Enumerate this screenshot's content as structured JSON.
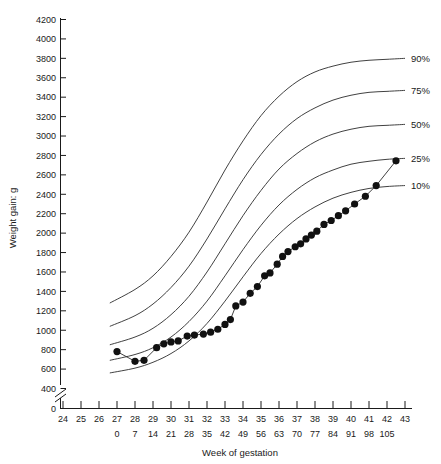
{
  "chart_data": {
    "type": "line",
    "title": "",
    "xlabel": "Week of gestation",
    "ylabel": "Weight gain: g",
    "xlim": [
      24,
      43
    ],
    "ylim": [
      400,
      4200
    ],
    "y_axis_break": true,
    "y_zero_label": "0",
    "grid": false,
    "legend_position": "right-inline",
    "x_ticks_weeks": [
      24,
      25,
      26,
      27,
      28,
      29,
      30,
      31,
      32,
      33,
      34,
      35,
      36,
      37,
      38,
      39,
      40,
      41,
      42,
      43
    ],
    "x_ticks_days": [
      {
        "week": 27,
        "day": 0
      },
      {
        "week": 28,
        "day": 7
      },
      {
        "week": 29,
        "day": 14
      },
      {
        "week": 30,
        "day": 21
      },
      {
        "week": 31,
        "day": 28
      },
      {
        "week": 32,
        "day": 35
      },
      {
        "week": 33,
        "day": 42
      },
      {
        "week": 34,
        "day": 49
      },
      {
        "week": 35,
        "day": 56
      },
      {
        "week": 36,
        "day": 63
      },
      {
        "week": 37,
        "day": 70
      },
      {
        "week": 38,
        "day": 77
      },
      {
        "week": 39,
        "day": 84
      },
      {
        "week": 40,
        "day": 91
      },
      {
        "week": 41,
        "day": 98
      },
      {
        "week": 42,
        "day": 105
      }
    ],
    "y_ticks": [
      400,
      600,
      800,
      1000,
      1200,
      1400,
      1600,
      1800,
      2000,
      2200,
      2400,
      2600,
      2800,
      3000,
      3200,
      3400,
      3600,
      3800,
      4000,
      4200
    ],
    "series": [
      {
        "name": "90%",
        "label": "90%",
        "type": "percentile_curve",
        "points": [
          {
            "x": 26.6,
            "y": 1280
          },
          {
            "x": 28.0,
            "y": 1420
          },
          {
            "x": 29.0,
            "y": 1560
          },
          {
            "x": 30.0,
            "y": 1760
          },
          {
            "x": 31.0,
            "y": 2010
          },
          {
            "x": 32.0,
            "y": 2320
          },
          {
            "x": 33.0,
            "y": 2650
          },
          {
            "x": 34.0,
            "y": 2950
          },
          {
            "x": 35.0,
            "y": 3210
          },
          {
            "x": 36.0,
            "y": 3410
          },
          {
            "x": 37.0,
            "y": 3560
          },
          {
            "x": 38.0,
            "y": 3660
          },
          {
            "x": 39.0,
            "y": 3720
          },
          {
            "x": 40.0,
            "y": 3760
          },
          {
            "x": 41.0,
            "y": 3780
          },
          {
            "x": 42.0,
            "y": 3790
          },
          {
            "x": 43.0,
            "y": 3800
          }
        ]
      },
      {
        "name": "75%",
        "label": "75%",
        "type": "percentile_curve",
        "points": [
          {
            "x": 26.6,
            "y": 1040
          },
          {
            "x": 28.0,
            "y": 1150
          },
          {
            "x": 29.0,
            "y": 1270
          },
          {
            "x": 30.0,
            "y": 1440
          },
          {
            "x": 31.0,
            "y": 1660
          },
          {
            "x": 32.0,
            "y": 1940
          },
          {
            "x": 33.0,
            "y": 2250
          },
          {
            "x": 34.0,
            "y": 2550
          },
          {
            "x": 35.0,
            "y": 2810
          },
          {
            "x": 36.0,
            "y": 3020
          },
          {
            "x": 37.0,
            "y": 3180
          },
          {
            "x": 38.0,
            "y": 3290
          },
          {
            "x": 39.0,
            "y": 3370
          },
          {
            "x": 40.0,
            "y": 3420
          },
          {
            "x": 41.0,
            "y": 3450
          },
          {
            "x": 42.0,
            "y": 3460
          },
          {
            "x": 43.0,
            "y": 3470
          }
        ]
      },
      {
        "name": "50%",
        "label": "50%",
        "type": "percentile_curve",
        "points": [
          {
            "x": 26.6,
            "y": 850
          },
          {
            "x": 28.0,
            "y": 930
          },
          {
            "x": 29.0,
            "y": 1020
          },
          {
            "x": 30.0,
            "y": 1160
          },
          {
            "x": 31.0,
            "y": 1350
          },
          {
            "x": 32.0,
            "y": 1600
          },
          {
            "x": 33.0,
            "y": 1890
          },
          {
            "x": 34.0,
            "y": 2180
          },
          {
            "x": 35.0,
            "y": 2440
          },
          {
            "x": 36.0,
            "y": 2660
          },
          {
            "x": 37.0,
            "y": 2820
          },
          {
            "x": 38.0,
            "y": 2940
          },
          {
            "x": 39.0,
            "y": 3020
          },
          {
            "x": 40.0,
            "y": 3070
          },
          {
            "x": 41.0,
            "y": 3100
          },
          {
            "x": 42.0,
            "y": 3110
          },
          {
            "x": 43.0,
            "y": 3120
          }
        ]
      },
      {
        "name": "25%",
        "label": "25%",
        "type": "percentile_curve",
        "points": [
          {
            "x": 26.6,
            "y": 690
          },
          {
            "x": 28.0,
            "y": 750
          },
          {
            "x": 29.0,
            "y": 820
          },
          {
            "x": 30.0,
            "y": 930
          },
          {
            "x": 31.0,
            "y": 1090
          },
          {
            "x": 32.0,
            "y": 1300
          },
          {
            "x": 33.0,
            "y": 1560
          },
          {
            "x": 34.0,
            "y": 1830
          },
          {
            "x": 35.0,
            "y": 2080
          },
          {
            "x": 36.0,
            "y": 2290
          },
          {
            "x": 37.0,
            "y": 2450
          },
          {
            "x": 38.0,
            "y": 2570
          },
          {
            "x": 39.0,
            "y": 2650
          },
          {
            "x": 40.0,
            "y": 2710
          },
          {
            "x": 41.0,
            "y": 2740
          },
          {
            "x": 42.0,
            "y": 2760
          },
          {
            "x": 43.0,
            "y": 2770
          }
        ]
      },
      {
        "name": "10%",
        "label": "10%",
        "type": "percentile_curve",
        "points": [
          {
            "x": 26.6,
            "y": 560
          },
          {
            "x": 28.0,
            "y": 610
          },
          {
            "x": 29.0,
            "y": 670
          },
          {
            "x": 30.0,
            "y": 760
          },
          {
            "x": 31.0,
            "y": 890
          },
          {
            "x": 32.0,
            "y": 1070
          },
          {
            "x": 33.0,
            "y": 1300
          },
          {
            "x": 34.0,
            "y": 1550
          },
          {
            "x": 35.0,
            "y": 1790
          },
          {
            "x": 36.0,
            "y": 1990
          },
          {
            "x": 37.0,
            "y": 2150
          },
          {
            "x": 38.0,
            "y": 2270
          },
          {
            "x": 39.0,
            "y": 2360
          },
          {
            "x": 40.0,
            "y": 2420
          },
          {
            "x": 41.0,
            "y": 2460
          },
          {
            "x": 42.0,
            "y": 2480
          },
          {
            "x": 43.0,
            "y": 2490
          }
        ]
      },
      {
        "name": "observed",
        "label": "",
        "type": "data_points",
        "marker": "filled-circle",
        "points": [
          {
            "x": 27.0,
            "y": 780
          },
          {
            "x": 28.0,
            "y": 680
          },
          {
            "x": 28.5,
            "y": 690
          },
          {
            "x": 29.2,
            "y": 820
          },
          {
            "x": 29.6,
            "y": 860
          },
          {
            "x": 30.0,
            "y": 880
          },
          {
            "x": 30.4,
            "y": 890
          },
          {
            "x": 30.9,
            "y": 940
          },
          {
            "x": 31.3,
            "y": 950
          },
          {
            "x": 31.8,
            "y": 960
          },
          {
            "x": 32.2,
            "y": 980
          },
          {
            "x": 32.6,
            "y": 1010
          },
          {
            "x": 33.0,
            "y": 1060
          },
          {
            "x": 33.3,
            "y": 1110
          },
          {
            "x": 33.6,
            "y": 1250
          },
          {
            "x": 34.0,
            "y": 1290
          },
          {
            "x": 34.4,
            "y": 1380
          },
          {
            "x": 34.8,
            "y": 1450
          },
          {
            "x": 35.2,
            "y": 1560
          },
          {
            "x": 35.5,
            "y": 1590
          },
          {
            "x": 35.9,
            "y": 1680
          },
          {
            "x": 36.2,
            "y": 1760
          },
          {
            "x": 36.5,
            "y": 1810
          },
          {
            "x": 36.9,
            "y": 1860
          },
          {
            "x": 37.2,
            "y": 1890
          },
          {
            "x": 37.5,
            "y": 1940
          },
          {
            "x": 37.8,
            "y": 1980
          },
          {
            "x": 38.1,
            "y": 2020
          },
          {
            "x": 38.5,
            "y": 2090
          },
          {
            "x": 38.9,
            "y": 2130
          },
          {
            "x": 39.3,
            "y": 2180
          },
          {
            "x": 39.7,
            "y": 2230
          },
          {
            "x": 40.2,
            "y": 2300
          },
          {
            "x": 40.8,
            "y": 2380
          },
          {
            "x": 41.4,
            "y": 2490
          },
          {
            "x": 42.5,
            "y": 2745
          }
        ]
      }
    ]
  },
  "axis": {
    "y_title": "Weight gain: g",
    "x_title": "Week of gestation",
    "zero_label": "0"
  }
}
